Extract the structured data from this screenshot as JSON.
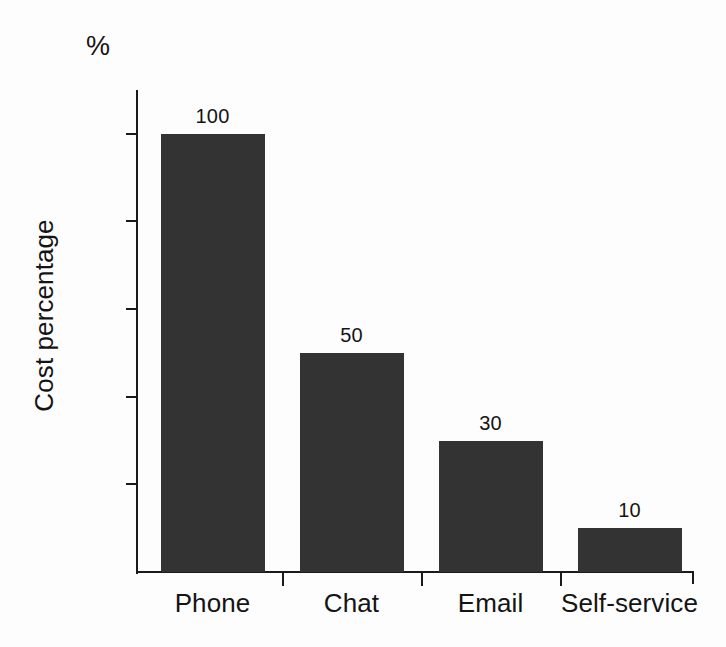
{
  "chart_data": {
    "type": "bar",
    "title": "",
    "subtitle": "",
    "categories": [
      "Phone",
      "Chat",
      "Email",
      "Self-service"
    ],
    "values": [
      100,
      50,
      30,
      10
    ],
    "data_labels": [
      "100",
      "50",
      "30",
      "10"
    ],
    "xlabel": "",
    "ylabel": "Cost percentage",
    "unit_label": "%",
    "ylim": [
      0,
      110
    ],
    "ytick_values": [
      100,
      80,
      60,
      40,
      20
    ],
    "ytick_labels": [
      "100",
      "80",
      "60",
      "40",
      "20"
    ],
    "grid": false,
    "legend": null,
    "legend_position": "none",
    "bar_color": "#333333",
    "axis_color": "#1a1a1a",
    "text_color": "#141414",
    "background_color": "#fdfdfd"
  }
}
